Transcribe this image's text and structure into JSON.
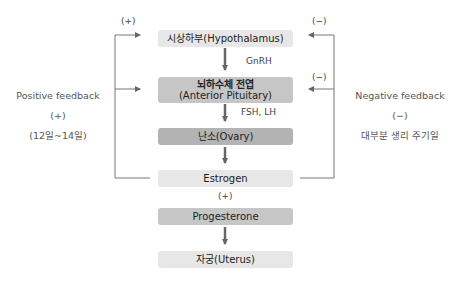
{
  "boxes": {
    "hypothalamus": "시상하부(Hypothalamus)",
    "pituitary_line1": "뇌하수체 전엽",
    "pituitary_line2": "(Anterior Pituitary)",
    "ovary": "난소(Ovary)",
    "estrogen": "Estrogen",
    "progesterone": "Progesterone",
    "uterus": "자궁(Uterus)"
  },
  "hormones": {
    "gnrh": "GnRH",
    "fsh_lh": "FSH, LH",
    "estrogen_to_progesterone": "(+)"
  },
  "positive_feedback": {
    "marker_top": "(+)",
    "title": "Positive feedback",
    "sign": "(+)",
    "period": "(12일~14일)"
  },
  "negative_feedback": {
    "marker_top": "(−)",
    "marker_mid": "(−)",
    "title": "Negative feedback",
    "sign": "(−)",
    "period": "대부분 생리 주기일"
  },
  "colors": {
    "light_box": "#e7e7e7",
    "mid_box": "#c6c6c6",
    "dark_box": "#b3b3b3",
    "line": "#777777",
    "arrow": "#666666"
  }
}
